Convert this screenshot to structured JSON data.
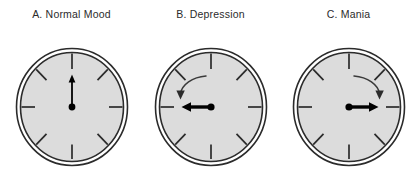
{
  "figure": {
    "title_present": false,
    "background_color": "#ffffff",
    "panel_count": 3
  },
  "style": {
    "face_fill": "#dcdcdc",
    "ring_stroke": "#2b2b2b",
    "tick_stroke": "#2b2b2b",
    "hand_color": "#000000",
    "arrow_color": "#2b2b2b",
    "caption_color": "#2b2b2b"
  },
  "panels": [
    {
      "id": "a",
      "caption": "A. Normal Mood",
      "clock": {
        "name": "normal-mood-clock",
        "hand_direction": "up",
        "hand_angle_deg": 0,
        "hand_style": "thin",
        "hub_dot": true,
        "rotation_arrow": "none",
        "tick_count": 8,
        "tick_interval_deg": 45
      }
    },
    {
      "id": "b",
      "caption": "B. Depression",
      "clock": {
        "name": "depression-clock",
        "hand_direction": "left",
        "hand_angle_deg": 270,
        "hand_style": "thick",
        "hub_dot": true,
        "rotation_arrow": "counter-clockwise",
        "tick_count": 8,
        "tick_interval_deg": 45
      }
    },
    {
      "id": "c",
      "caption": "C. Mania",
      "clock": {
        "name": "mania-clock",
        "hand_direction": "right",
        "hand_angle_deg": 90,
        "hand_style": "thick",
        "hub_dot": true,
        "rotation_arrow": "clockwise",
        "tick_count": 8,
        "tick_interval_deg": 45
      }
    }
  ]
}
